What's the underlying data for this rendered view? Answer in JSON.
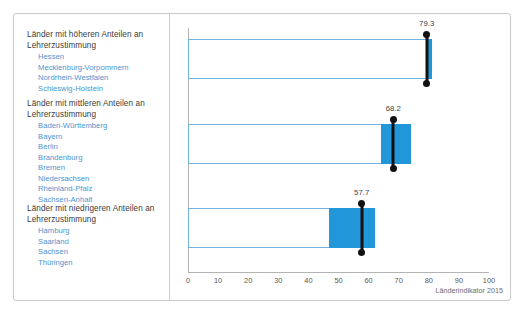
{
  "source_note": "Länderindikator 2015",
  "colors": {
    "fill": "#2196d9",
    "outline": "#6fb3e0",
    "marker": "#111111",
    "state_text": "#4f94d0",
    "heading_text": "#3b3b3b"
  },
  "groups": [
    {
      "heading": "Länder mit höheren Anteilen an Lehrerzustimmung",
      "states": [
        "Hessen",
        "Mecklenburg-Vorpommern",
        "Nordrhein-Westfalen",
        "Schleswig-Holstein"
      ]
    },
    {
      "heading": "Länder mit mittleren Anteilen an Lehrerzustimmung",
      "states": [
        "Baden-Württemberg",
        "Bayern",
        "Berlin",
        "Brandenburg",
        "Bremen",
        "Niedersachsen",
        "Rheinland-Pfalz",
        "Sachsen-Anhalt"
      ]
    },
    {
      "heading": "Länder mit niedrigeren Anteilen an Lehrerzustimmung",
      "states": [
        "Hamburg",
        "Saarland",
        "Sachsen",
        "Thüringen"
      ]
    }
  ],
  "chart_data": {
    "type": "bar",
    "title": "",
    "xlabel": "",
    "ylabel": "",
    "xlim": [
      0,
      100
    ],
    "grid": false,
    "legend": "none",
    "tick_labels": [
      "0",
      "10",
      "20",
      "30",
      "40",
      "50",
      "60",
      "70",
      "80",
      "90",
      "100"
    ],
    "ticks": [
      0,
      10,
      20,
      30,
      40,
      50,
      60,
      70,
      80,
      90,
      100
    ],
    "categories": [
      "Länder mit höheren Anteilen an Lehrerzustimmung",
      "Länder mit mittleren Anteilen an Lehrerzustimmung",
      "Länder mit niedrigeren Anteilen an Lehrerzustimmung"
    ],
    "values": [
      79.3,
      68.2,
      57.7
    ],
    "bars": [
      {
        "category": "Länder mit höheren Anteilen an Lehrerzustimmung",
        "value": 79.3,
        "value_label": "79.3",
        "outline_start": 0,
        "outline_end": 81.0,
        "fill_start": 79.0,
        "fill_end": 81.0
      },
      {
        "category": "Länder mit mittleren Anteilen an Lehrerzustimmung",
        "value": 68.2,
        "value_label": "68.2",
        "outline_start": 0,
        "outline_end": 74.0,
        "fill_start": 64.0,
        "fill_end": 74.0
      },
      {
        "category": "Länder mit niedrigeren Anteilen an Lehrerzustimmung",
        "value": 57.7,
        "value_label": "57.7",
        "outline_start": 0,
        "outline_end": 62.0,
        "fill_start": 47.0,
        "fill_end": 62.0
      }
    ]
  }
}
